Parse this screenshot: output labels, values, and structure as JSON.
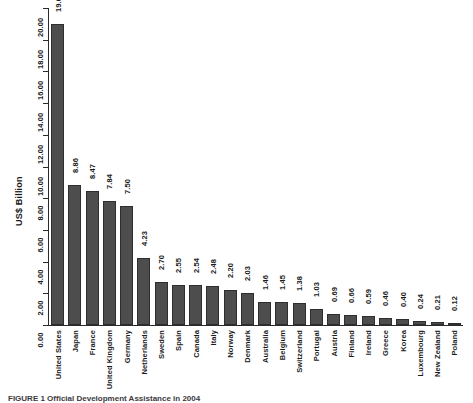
{
  "chart_data": {
    "type": "bar",
    "title": "",
    "subtitle": "",
    "xlabel": "",
    "ylabel": "US$ Billion",
    "ylim": [
      0,
      20
    ],
    "ytick_labels": [
      "0.00",
      "2.00",
      "4.00",
      "6.00",
      "8.00",
      "10.00",
      "12.00",
      "14.00",
      "16.00",
      "18.00",
      "20.00"
    ],
    "ytick_values": [
      0,
      2,
      4,
      6,
      8,
      10,
      12,
      14,
      16,
      18,
      20
    ],
    "grid": false,
    "legend": null,
    "bar_color": "#4d4d4d",
    "bar_edge_color": "#2e2e2e",
    "categories": [
      "United States",
      "Japan",
      "France",
      "United Kingdom",
      "Germany",
      "Netherlands",
      "Sweden",
      "Spain",
      "Canada",
      "Italy",
      "Norway",
      "Denmark",
      "Australia",
      "Belgium",
      "Switzerland",
      "Portugal",
      "Austria",
      "Finland",
      "Ireland",
      "Greece",
      "Korea",
      "Luxembourg",
      "New Zealand",
      "Poland"
    ],
    "values": [
      19.0,
      8.86,
      8.47,
      7.84,
      7.5,
      4.23,
      2.7,
      2.55,
      2.54,
      2.48,
      2.2,
      2.03,
      1.46,
      1.45,
      1.38,
      1.03,
      0.69,
      0.66,
      0.59,
      0.46,
      0.4,
      0.24,
      0.21,
      0.12
    ],
    "value_labels": [
      "19.00",
      "8.86",
      "8.47",
      "7.84",
      "7.50",
      "4.23",
      "2.70",
      "2.55",
      "2.54",
      "2.48",
      "2.20",
      "2.03",
      "1.46",
      "1.45",
      "1.38",
      "1.03",
      "0.69",
      "0.66",
      "0.59",
      "0.46",
      "0.40",
      "0.24",
      "0.21",
      "0.12"
    ]
  },
  "caption": "FIGURE 1    Official Development Assistance in 2004"
}
